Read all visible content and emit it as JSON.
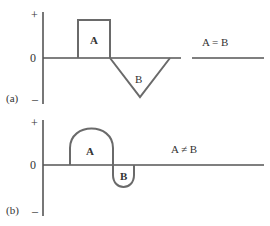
{
  "panels": [
    {
      "id": "a",
      "label": "(a)",
      "axis": {
        "plus": "+",
        "zero": "0",
        "minus": "–"
      },
      "regions": [
        {
          "name": "A",
          "shape": "rectangle",
          "sign": "positive"
        },
        {
          "name": "B",
          "shape": "triangle",
          "sign": "negative"
        }
      ],
      "relation": "A = B"
    },
    {
      "id": "b",
      "label": "(b)",
      "axis": {
        "plus": "+",
        "zero": "0",
        "minus": "–"
      },
      "regions": [
        {
          "name": "A",
          "shape": "arch",
          "sign": "positive"
        },
        {
          "name": "B",
          "shape": "loop",
          "sign": "negative"
        }
      ],
      "relation": "A ≠ B"
    }
  ],
  "colors": {
    "line": "#6a6a6a",
    "axis": "#555555",
    "text": "#333333"
  }
}
